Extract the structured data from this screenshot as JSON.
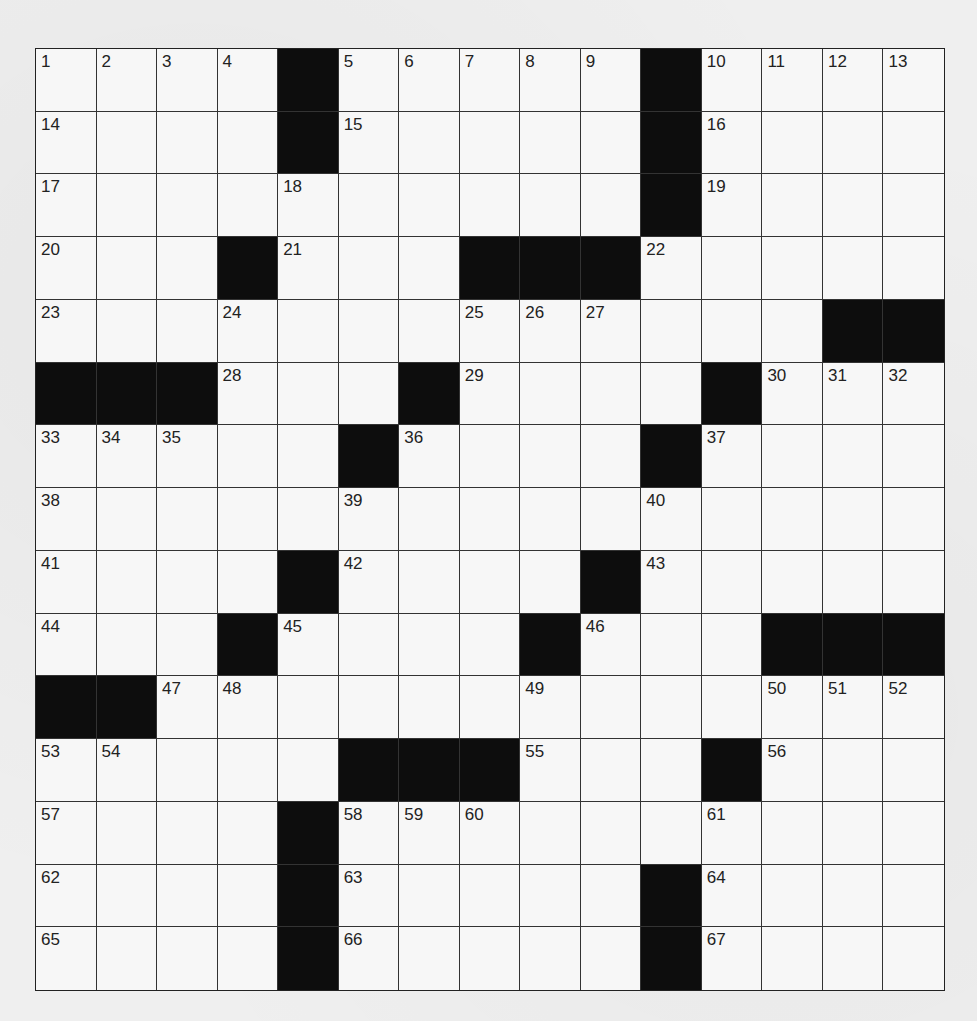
{
  "puzzle": {
    "type": "crossword",
    "size": {
      "rows": 15,
      "cols": 15
    },
    "colors": {
      "black_square": "#0d0d0d",
      "white_square": "#f7f7f7",
      "grid_line": "#333333",
      "page": "#efefef"
    },
    "rows": [
      [
        "1",
        "2",
        "3",
        "4",
        "#",
        "5",
        "6",
        "7",
        "8",
        "9",
        "#",
        "10",
        "11",
        "12",
        "13"
      ],
      [
        "14",
        "",
        "",
        "",
        "#",
        "15",
        "",
        "",
        "",
        "",
        "#",
        "16",
        "",
        "",
        ""
      ],
      [
        "17",
        "",
        "",
        "",
        "18",
        "",
        "",
        "",
        "",
        "",
        "#",
        "19",
        "",
        "",
        ""
      ],
      [
        "20",
        "",
        "",
        "#",
        "21",
        "",
        "",
        "#",
        "#",
        "#",
        "22",
        "",
        "",
        "",
        ""
      ],
      [
        "23",
        "",
        "",
        "24",
        "",
        "",
        "",
        "25",
        "26",
        "27",
        "",
        "",
        "",
        "#",
        "#"
      ],
      [
        "#",
        "#",
        "#",
        "28",
        "",
        "",
        "#",
        "29",
        "",
        "",
        "",
        "#",
        "30",
        "31",
        "32"
      ],
      [
        "33",
        "34",
        "35",
        "",
        "",
        "#",
        "36",
        "",
        "",
        "",
        "#",
        "37",
        "",
        "",
        ""
      ],
      [
        "38",
        "",
        "",
        "",
        "",
        "39",
        "",
        "",
        "",
        "",
        "40",
        "",
        "",
        "",
        ""
      ],
      [
        "41",
        "",
        "",
        "",
        "#",
        "42",
        "",
        "",
        "",
        "#",
        "43",
        "",
        "",
        "",
        ""
      ],
      [
        "44",
        "",
        "",
        "#",
        "45",
        "",
        "",
        "",
        "#",
        "46",
        "",
        "",
        "#",
        "#",
        "#"
      ],
      [
        "#",
        "#",
        "47",
        "48",
        "",
        "",
        "",
        "",
        "49",
        "",
        "",
        "",
        "50",
        "51",
        "52"
      ],
      [
        "53",
        "54",
        "",
        "",
        "",
        "#",
        "#",
        "#",
        "55",
        "",
        "",
        "#",
        "56",
        "",
        ""
      ],
      [
        "57",
        "",
        "",
        "",
        "#",
        "58",
        "59",
        "60",
        "",
        "",
        "",
        "61",
        "",
        "",
        ""
      ],
      [
        "62",
        "",
        "",
        "",
        "#",
        "63",
        "",
        "",
        "",
        "",
        "#",
        "64",
        "",
        "",
        ""
      ],
      [
        "65",
        "",
        "",
        "",
        "#",
        "66",
        "",
        "",
        "",
        "",
        "#",
        "67",
        "",
        "",
        ""
      ]
    ]
  }
}
